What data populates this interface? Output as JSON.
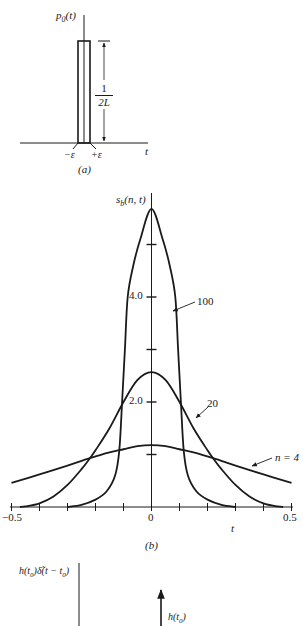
{
  "panel_a": {
    "y_label": "p0(t)",
    "y_label_parts": {
      "base": "p",
      "sub": "0",
      "arg": "(t)"
    },
    "height_fraction": {
      "numerator": "1",
      "denominator": "2L"
    },
    "x_label": "t",
    "left_tick": "−ε",
    "right_tick": "+ε",
    "caption": "(a)"
  },
  "panel_b": {
    "y_label_parts": {
      "base": "s",
      "sub": "b",
      "arg": "(n, t)"
    },
    "x_label": "t",
    "caption": "(b)",
    "x_tick_labels": [
      {
        "t": -0.5,
        "text": "−0.5"
      },
      {
        "t": 0,
        "text": "0"
      },
      {
        "t": 0.5,
        "text": "0.5"
      }
    ],
    "y_tick_labels": [
      {
        "v": 4.0,
        "text": "4.0"
      },
      {
        "v": 2.0,
        "text": "2.0"
      }
    ],
    "curve_labels": [
      {
        "text": "100",
        "x": 197,
        "y": 296,
        "arrow_from": [
          195,
          302
        ],
        "arrow_to": [
          173,
          311
        ]
      },
      {
        "text": "20",
        "x": 207,
        "y": 398,
        "arrow_from": [
          208,
          407
        ],
        "arrow_to": [
          196,
          418
        ]
      },
      {
        "text": "n = 4",
        "x": 275,
        "y": 452,
        "arrow_from": [
          272,
          458
        ],
        "arrow_to": [
          252,
          466
        ]
      }
    ]
  },
  "panel_c": {
    "y_label_parts": {
      "pre": "h(t",
      "sub1": "0",
      "mid": ")δ̃(t − t",
      "sub2": "0",
      "post": ")"
    },
    "impulse_label_parts": {
      "pre": "h(t",
      "sub": "0",
      "post": ")"
    }
  },
  "chart_data": {
    "type": "line",
    "title": "",
    "xlabel": "t",
    "ylabel": "s_b(n, t)",
    "xlim": [
      -0.5,
      0.5
    ],
    "ylim": [
      0,
      5.7
    ],
    "x_ticks": [
      -0.5,
      -0.4,
      -0.3,
      -0.2,
      -0.1,
      0,
      0.1,
      0.2,
      0.3,
      0.4,
      0.5
    ],
    "y_ticks": [
      1.0,
      2.0,
      3.0,
      4.0,
      5.0
    ],
    "grid": false,
    "series": [
      {
        "name": "n = 100",
        "x": [
          -0.3,
          -0.25,
          -0.2,
          -0.16,
          -0.13,
          -0.115,
          -0.105,
          -0.095,
          -0.085,
          -0.065,
          -0.04,
          0,
          0.04,
          0.065,
          0.085,
          0.095,
          0.105,
          0.115,
          0.13,
          0.16,
          0.2,
          0.25,
          0.3
        ],
        "values": [
          0,
          0.04,
          0.14,
          0.3,
          0.6,
          1.08,
          2.0,
          3.0,
          4.0,
          4.6,
          5.1,
          5.68,
          5.1,
          4.6,
          4.0,
          3.0,
          2.0,
          1.08,
          0.6,
          0.3,
          0.14,
          0.04,
          0
        ]
      },
      {
        "name": "n = 20",
        "x": [
          -0.47,
          -0.45,
          -0.4,
          -0.35,
          -0.3,
          -0.25,
          -0.22,
          -0.2,
          -0.15,
          -0.1,
          -0.05,
          0,
          0.05,
          0.1,
          0.15,
          0.2,
          0.22,
          0.25,
          0.3,
          0.35,
          0.4,
          0.45,
          0.47
        ],
        "values": [
          0,
          0.01,
          0.07,
          0.2,
          0.42,
          0.72,
          0.93,
          1.08,
          1.5,
          2.0,
          2.42,
          2.57,
          2.42,
          2.0,
          1.5,
          1.08,
          0.93,
          0.72,
          0.42,
          0.2,
          0.07,
          0.01,
          0
        ]
      },
      {
        "name": "n = 4",
        "x": [
          -0.5,
          -0.4,
          -0.3,
          -0.22,
          -0.15,
          -0.1,
          -0.05,
          0,
          0.05,
          0.1,
          0.15,
          0.22,
          0.3,
          0.4,
          0.5
        ],
        "values": [
          0.46,
          0.62,
          0.79,
          0.93,
          1.04,
          1.1,
          1.16,
          1.18,
          1.16,
          1.1,
          1.04,
          0.93,
          0.79,
          0.62,
          0.46
        ]
      }
    ]
  }
}
